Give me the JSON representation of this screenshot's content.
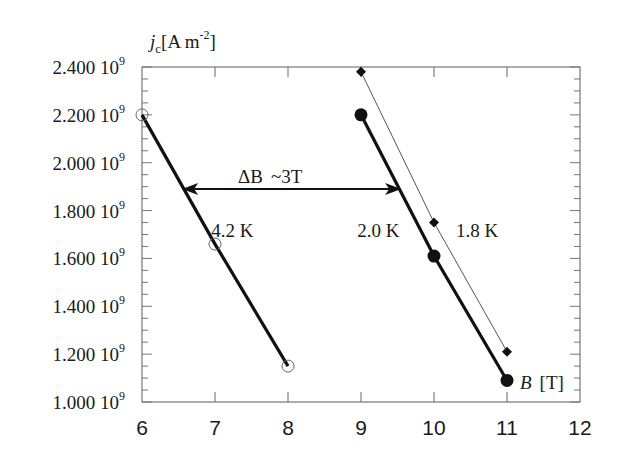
{
  "chart_data": {
    "type": "line",
    "title": "",
    "ylabel_main": "j",
    "ylabel_sub": "c",
    "ylabel_unit": "[A m",
    "ylabel_exp": "-2",
    "ylabel_close": "]",
    "xlabel_var": "B",
    "xlabel_unit": "[T]",
    "xlim": [
      6,
      12
    ],
    "ylim": [
      1000000000.0,
      2400000000.0
    ],
    "xticks": [
      6,
      7,
      8,
      9,
      10,
      11,
      12
    ],
    "xtick_labels": [
      "6",
      "7",
      "8",
      "9",
      "10",
      "11",
      "12"
    ],
    "yticks": [
      1000000000.0,
      1200000000.0,
      1400000000.0,
      1600000000.0,
      1800000000.0,
      2000000000.0,
      2200000000.0,
      2400000000.0
    ],
    "ytick_labels": [
      {
        "mant": "1.000 10",
        "exp": "9"
      },
      {
        "mant": "1.200 10",
        "exp": "9"
      },
      {
        "mant": "1.400 10",
        "exp": "9"
      },
      {
        "mant": "1.600 10",
        "exp": "9"
      },
      {
        "mant": "1.800 10",
        "exp": "9"
      },
      {
        "mant": "2.000 10",
        "exp": "9"
      },
      {
        "mant": "2.200 10",
        "exp": "9"
      },
      {
        "mant": "2.400 10",
        "exp": "9"
      }
    ],
    "grid": false,
    "series": [
      {
        "name": "4.2 K",
        "marker": "open-circle",
        "line": "thick",
        "x": [
          6,
          7,
          8
        ],
        "y": [
          2200000000.0,
          1660000000.0,
          1150000000.0
        ]
      },
      {
        "name": "2.0 K",
        "marker": "filled-circle",
        "line": "thick",
        "x": [
          9,
          10,
          11
        ],
        "y": [
          2200000000.0,
          1610000000.0,
          1090000000.0
        ]
      },
      {
        "name": "1.8 K",
        "marker": "filled-diamond",
        "line": "thin",
        "x": [
          9,
          10,
          11
        ],
        "y": [
          2380000000.0,
          1750000000.0,
          1210000000.0
        ]
      }
    ],
    "annotations": [
      {
        "text": "4.2 K",
        "x": 6.95,
        "y": 1720000000.0
      },
      {
        "text": "2.0 K",
        "x": 8.95,
        "y": 1720000000.0
      },
      {
        "text": "1.8 K",
        "x": 10.3,
        "y": 1720000000.0
      }
    ],
    "arrow": {
      "label_var": "ΔB",
      "label_val": "~3T",
      "x_from": 6.55,
      "x_to": 9.55,
      "y": 1890000000.0
    }
  }
}
